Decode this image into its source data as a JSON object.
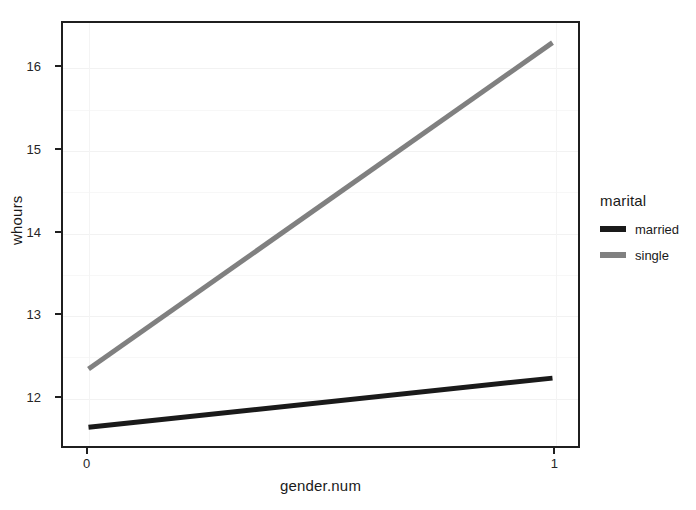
{
  "chart_data": {
    "type": "line",
    "title": "",
    "xlabel": "gender.num",
    "ylabel": "whours",
    "x": [
      0,
      1
    ],
    "xlim": [
      -0.055,
      1.055
    ],
    "ylim": [
      11.38,
      16.55
    ],
    "xticks": [
      "0",
      "1"
    ],
    "xtick_values": [
      0,
      1
    ],
    "yticks": [
      "12",
      "13",
      "14",
      "15",
      "16"
    ],
    "ytick_values": [
      12,
      13,
      14,
      15,
      16
    ],
    "grid": "faint-horizontal",
    "legend_position": "right",
    "legend_title": "marital",
    "series": [
      {
        "name": "married",
        "values": [
          11.61,
          12.21
        ],
        "color": "#1a1a1a",
        "width": 5
      },
      {
        "name": "single",
        "values": [
          12.32,
          16.31
        ],
        "color": "#808080",
        "width": 5
      }
    ]
  },
  "axes": {
    "y_title": "whours",
    "x_title": "gender.num"
  },
  "legend": {
    "title": "marital",
    "entries": [
      {
        "label": "married",
        "color": "#1a1a1a"
      },
      {
        "label": "single",
        "color": "#808080"
      }
    ]
  },
  "colors": {
    "frame": "#1f1f1f",
    "background": "#ffffff",
    "grid": "#f2f2f2",
    "text": "#1a1a1a",
    "married": "#1a1a1a",
    "single": "#808080"
  }
}
